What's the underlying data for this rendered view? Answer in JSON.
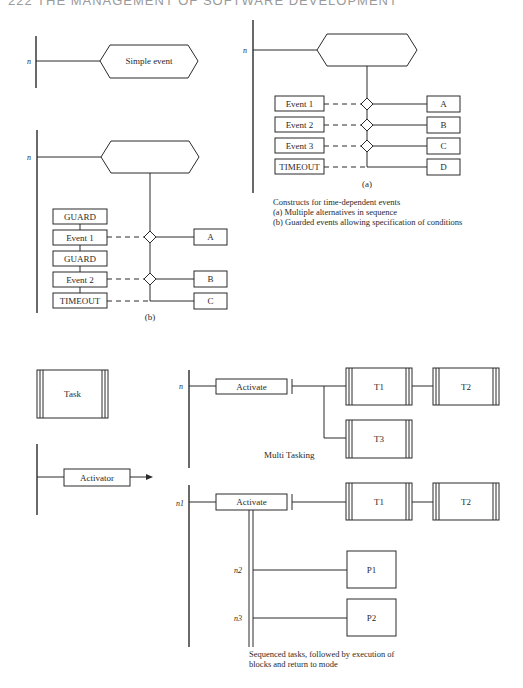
{
  "page": {
    "header": "222   THE MANAGEMENT OF SOFTWARE DEVELOPMENT"
  },
  "simple_event": {
    "node_label": "n",
    "event_label": "Simple event"
  },
  "diagram_a": {
    "node_label": "n",
    "events": [
      "Event 1",
      "Event 2",
      "Event 3",
      "TIMEOUT"
    ],
    "outcomes": [
      "A",
      "B",
      "C",
      "D"
    ],
    "sublabel": "(a)"
  },
  "diagram_b": {
    "node_label": "n",
    "stack": [
      "GUARD",
      "Event 1",
      "GUARD",
      "Event 2",
      "TIMEOUT"
    ],
    "outcomes": [
      "A",
      "B",
      "C"
    ],
    "sublabel": "(b)"
  },
  "caption_events": {
    "line1": "Constructs for time-dependent events",
    "line2": "(a) Multiple alternatives in sequence",
    "line3": "(b) Guarded events allowing specification of conditions"
  },
  "task_symbol": {
    "label": "Task"
  },
  "activator_symbol": {
    "label": "Activator"
  },
  "multi_tasking": {
    "node_label": "n",
    "activate_label": "Activate",
    "tasks": [
      "T1",
      "T2",
      "T3"
    ],
    "caption": "Multi Tasking"
  },
  "sequenced": {
    "node_labels": [
      "n1",
      "n2",
      "n3"
    ],
    "activate_label": "Activate",
    "tasks": [
      "T1",
      "T2"
    ],
    "processes": [
      "P1",
      "P2"
    ],
    "caption_line1": "Sequenced tasks, followed by execution of",
    "caption_line2": "blocks and return to mode"
  }
}
